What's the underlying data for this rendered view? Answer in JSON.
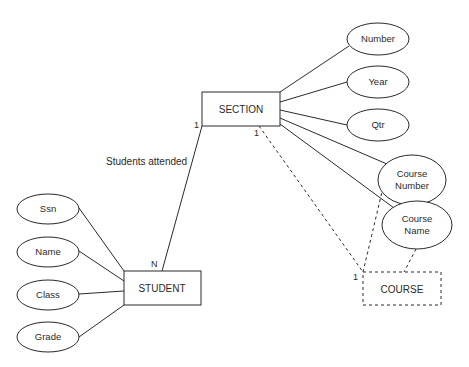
{
  "diagram": {
    "type": "ER diagram",
    "entities": [
      {
        "id": "section",
        "label": "SECTION",
        "weak": false
      },
      {
        "id": "student",
        "label": "STUDENT",
        "weak": false
      },
      {
        "id": "course",
        "label": "COURSE",
        "weak": true
      }
    ],
    "attributes": {
      "section": [
        {
          "label": "Number"
        },
        {
          "label": "Year"
        },
        {
          "label": "Qtr"
        },
        {
          "label_line1": "Course",
          "label_line2": "Number"
        },
        {
          "label_line1": "Course",
          "label_line2": "Name"
        }
      ],
      "student": [
        {
          "label": "Ssn"
        },
        {
          "label": "Name"
        },
        {
          "label": "Class"
        },
        {
          "label": "Grade"
        }
      ]
    },
    "relationships": [
      {
        "label": "Students attended",
        "from": "SECTION",
        "to": "STUDENT",
        "card_from": "1",
        "card_to": "N"
      },
      {
        "label": "",
        "from": "SECTION",
        "to": "COURSE",
        "card_from": "1",
        "card_to": "1",
        "dashed": true
      }
    ],
    "colors": {
      "stroke": "#2a2a2a",
      "background": "#ffffff"
    }
  }
}
